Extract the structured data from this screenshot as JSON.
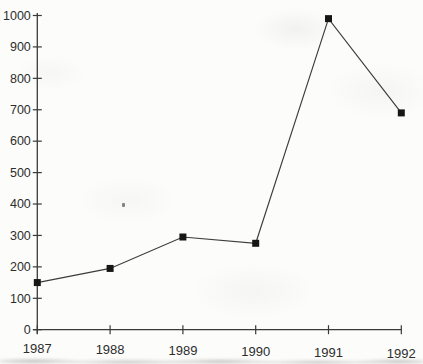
{
  "page": {
    "background": "#fcfcfb"
  },
  "chart_data": {
    "type": "line",
    "x": [
      "1987",
      "1988",
      "1989",
      "1990",
      "1991",
      "1992"
    ],
    "values": [
      150,
      195,
      295,
      275,
      990,
      690
    ],
    "yticks": [
      0,
      100,
      200,
      300,
      400,
      500,
      600,
      700,
      800,
      900,
      1000
    ],
    "ylim": [
      0,
      1000
    ],
    "xlabel": "",
    "ylabel": "",
    "grid": false,
    "legend": "none",
    "marker": "filled-square",
    "colors": {
      "line": "#3c3c3a",
      "marker": "#161614",
      "axis": "#3a3a38",
      "labels": "#2d2d2b"
    }
  }
}
